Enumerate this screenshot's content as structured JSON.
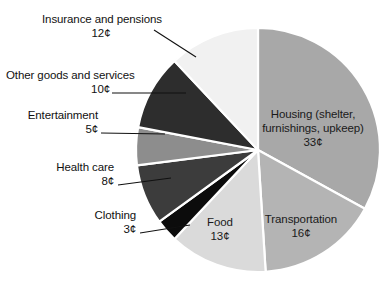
{
  "chart_data": {
    "type": "pie",
    "title": "",
    "subtitle": "",
    "units": "cents",
    "total": 100,
    "legend_position": "none",
    "grid": false,
    "categories": [
      "Housing (shelter, furnishings, upkeep)",
      "Transportation",
      "Food",
      "Clothing",
      "Health care",
      "Entertainment",
      "Other goods and services",
      "Insurance and pensions"
    ],
    "values": [
      33,
      16,
      13,
      3,
      8,
      5,
      10,
      12
    ],
    "value_labels": [
      "33¢",
      "16¢",
      "13¢",
      "3¢",
      "8¢",
      "5¢",
      "10¢",
      "12¢"
    ],
    "colors": [
      "#a8a8a8",
      "#b4b4b4",
      "#dadada",
      "#0c0c0c",
      "#3c3c3c",
      "#8d8d8d",
      "#2d2d2d",
      "#f1f1f1"
    ],
    "start_angle_deg": 0,
    "direction": "clockwise",
    "slice_gap_color": "#ffffff"
  },
  "slices": [
    {
      "key": "housing",
      "name_line1": "Housing (shelter,",
      "name_line2": "furnishings, upkeep)",
      "value": "33¢",
      "color": "#a8a8a8",
      "label_placement": "inside"
    },
    {
      "key": "transportation",
      "name_line1": "Transportation",
      "name_line2": "",
      "value": "16¢",
      "color": "#b4b4b4",
      "label_placement": "inside"
    },
    {
      "key": "food",
      "name_line1": "Food",
      "name_line2": "",
      "value": "13¢",
      "color": "#dadada",
      "label_placement": "inside"
    },
    {
      "key": "clothing",
      "name_line1": "Clothing",
      "name_line2": "",
      "value": "3¢",
      "color": "#0c0c0c",
      "label_placement": "callout"
    },
    {
      "key": "health-care",
      "name_line1": "Health care",
      "name_line2": "",
      "value": "8¢",
      "color": "#3c3c3c",
      "label_placement": "callout"
    },
    {
      "key": "entertainment",
      "name_line1": "Entertainment",
      "name_line2": "",
      "value": "5¢",
      "color": "#8d8d8d",
      "label_placement": "callout"
    },
    {
      "key": "other-goods-and-services",
      "name_line1": "Other goods and services",
      "name_line2": "",
      "value": "10¢",
      "color": "#2d2d2d",
      "label_placement": "callout"
    },
    {
      "key": "insurance-and-pensions",
      "name_line1": "Insurance and pensions",
      "name_line2": "",
      "value": "12¢",
      "color": "#f1f1f1",
      "label_placement": "callout"
    }
  ],
  "labels": {
    "insurance_name": "Insurance and pensions",
    "insurance_value": "12¢",
    "other_goods_name": "Other goods and services",
    "other_goods_value": "10¢",
    "entertainment_name": "Entertainment",
    "entertainment_value": "5¢",
    "health_care_name": "Health care",
    "health_care_value": "8¢",
    "clothing_name": "Clothing",
    "clothing_value": "3¢",
    "housing_name_line1": "Housing (shelter,",
    "housing_name_line2": "furnishings, upkeep)",
    "housing_value": "33¢",
    "transportation_name": "Transportation",
    "transportation_value": "16¢",
    "food_name": "Food",
    "food_value": "13¢"
  }
}
